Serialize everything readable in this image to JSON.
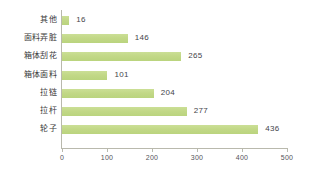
{
  "chart_data": {
    "type": "bar",
    "orientation": "horizontal",
    "title": "",
    "xlabel": "",
    "ylabel": "",
    "categories": [
      "其他",
      "面料弄脏",
      "箱体刮花",
      "箱体面料",
      "拉链",
      "拉杆",
      "轮子"
    ],
    "values": [
      16,
      146,
      265,
      101,
      204,
      277,
      436
    ],
    "value_labels": [
      "16",
      "146",
      "265",
      "101",
      "204",
      "277",
      "436"
    ],
    "xlim": [
      0,
      500
    ],
    "xticks": [
      0,
      100,
      200,
      300,
      400,
      500
    ],
    "xtick_labels": [
      "0",
      "100",
      "200",
      "300",
      "400",
      "500"
    ],
    "grid": false,
    "legend": false,
    "bar_color": "#c2d887",
    "axis_color": "#b9b9ad",
    "text_color": "#3a3a3a",
    "background": "#ffffff"
  }
}
